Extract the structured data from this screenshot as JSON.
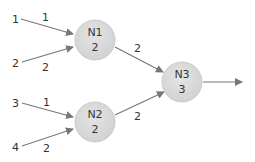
{
  "colors": {
    "node_fill": "#d9d9d9",
    "node_stroke": "#c8c8c8",
    "edge": "#777777",
    "text": "#333333"
  },
  "nodes": [
    {
      "id": "N1",
      "name": "N1",
      "value": "2"
    },
    {
      "id": "N2",
      "name": "N2",
      "value": "2"
    },
    {
      "id": "N3",
      "name": "N3",
      "value": "3"
    }
  ],
  "inputs": [
    {
      "label": "1",
      "weight": "1",
      "target": "N1"
    },
    {
      "label": "2",
      "weight": "2",
      "target": "N1"
    },
    {
      "label": "3",
      "weight": "1",
      "target": "N2"
    },
    {
      "label": "4",
      "weight": "2",
      "target": "N2"
    }
  ],
  "edges": [
    {
      "from": "N1",
      "to": "N3",
      "weight": "2"
    },
    {
      "from": "N2",
      "to": "N3",
      "weight": "2"
    }
  ],
  "output": {
    "from": "N3"
  }
}
